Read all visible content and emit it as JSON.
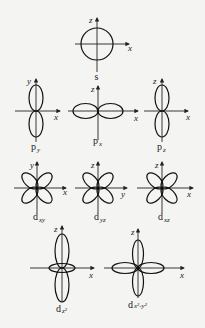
{
  "diagram": {
    "orbitals": [
      {
        "id": "s",
        "name": "s",
        "sub": "",
        "axes": {
          "vertical": "z",
          "horizontal": "x"
        }
      },
      {
        "id": "py",
        "name": "p",
        "sub": "y",
        "axes": {
          "vertical": "y",
          "horizontal": "x"
        }
      },
      {
        "id": "px",
        "name": "p",
        "sub": "x",
        "axes": {
          "vertical": "z",
          "horizontal": "x"
        }
      },
      {
        "id": "pz",
        "name": "p",
        "sub": "z",
        "axes": {
          "vertical": "z",
          "horizontal": "x"
        }
      },
      {
        "id": "dxy",
        "name": "d",
        "sub": "xy",
        "axes": {
          "vertical": "y",
          "horizontal": "x"
        }
      },
      {
        "id": "dyz",
        "name": "d",
        "sub": "yz",
        "axes": {
          "vertical": "z",
          "horizontal": "y"
        }
      },
      {
        "id": "dxz",
        "name": "d",
        "sub": "xz",
        "axes": {
          "vertical": "z",
          "horizontal": "x"
        }
      },
      {
        "id": "dz2",
        "name": "d",
        "sub": "z²",
        "axes": {
          "vertical": "z",
          "horizontal": "x"
        }
      },
      {
        "id": "dx2y2",
        "name": "d",
        "sub": "x²-y²",
        "axes": {
          "vertical": "z",
          "horizontal": "x"
        }
      }
    ]
  },
  "colors": {
    "stroke": "#111111",
    "background": "#f4f4f2"
  }
}
